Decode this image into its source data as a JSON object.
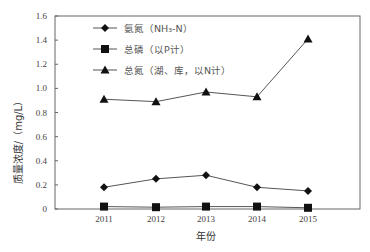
{
  "chart_data": {
    "type": "line",
    "title": "",
    "xlabel": "年份",
    "ylabel": "质量浓度/（mg/L）",
    "categories": [
      "2011",
      "2012",
      "2013",
      "2014",
      "2015"
    ],
    "ylim": [
      0,
      1.6
    ],
    "yticks": [
      "0",
      "0.2",
      "0.4",
      "0.6",
      "0.8",
      "1.0",
      "1.2",
      "1.4",
      "1.6"
    ],
    "grid": false,
    "legend_position": "upper-left-inside",
    "series": [
      {
        "name": "氨氮（NH₃-N）",
        "marker": "diamond",
        "values": [
          0.18,
          0.25,
          0.28,
          0.18,
          0.15
        ]
      },
      {
        "name": "总磷（以P计）",
        "marker": "square",
        "values": [
          0.02,
          0.015,
          0.02,
          0.02,
          0.01
        ]
      },
      {
        "name": "总氮（湖、库，以N计）",
        "marker": "triangle",
        "values": [
          0.91,
          0.89,
          0.97,
          0.93,
          1.41
        ]
      }
    ]
  },
  "colors": {
    "line": "#555555",
    "marker": "#111111",
    "axis": "#666666"
  }
}
